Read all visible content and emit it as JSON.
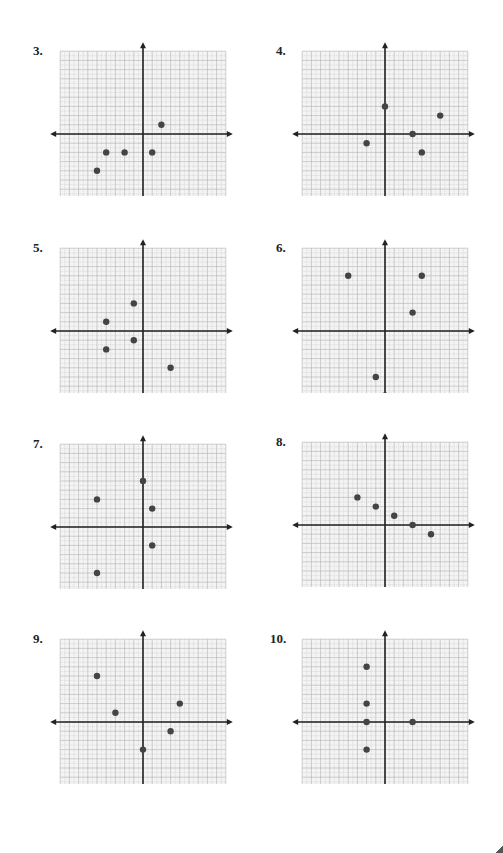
{
  "page": {
    "grid": {
      "min": -9,
      "max": 9,
      "unit_px": 9.2,
      "minor_grid_color": "#c8c8c8",
      "major_grid_color": "#b0b0b0",
      "background": "#f4f4f4",
      "axis_color": "#222222",
      "point_color": "#444444"
    }
  },
  "chart_data": [
    {
      "type": "scatter",
      "title": "3.",
      "xlim": [
        -9,
        9
      ],
      "ylim": [
        -9,
        9
      ],
      "grid": true,
      "x": [
        2,
        -4,
        -2,
        1,
        -5
      ],
      "y": [
        1,
        -2,
        -2,
        -2,
        -4
      ],
      "points": [
        [
          2,
          1
        ],
        [
          -4,
          -2
        ],
        [
          -2,
          -2
        ],
        [
          1,
          -2
        ],
        [
          -5,
          -4
        ]
      ]
    },
    {
      "type": "scatter",
      "title": "4.",
      "xlim": [
        -9,
        9
      ],
      "ylim": [
        -9,
        9
      ],
      "grid": true,
      "x": [
        0,
        6,
        3,
        -2,
        4
      ],
      "y": [
        3,
        2,
        0,
        -1,
        -2
      ],
      "points": [
        [
          0,
          3
        ],
        [
          6,
          2
        ],
        [
          3,
          0
        ],
        [
          -2,
          -1
        ],
        [
          4,
          -2
        ]
      ]
    },
    {
      "type": "scatter",
      "title": "5.",
      "xlim": [
        -9,
        9
      ],
      "ylim": [
        -9,
        9
      ],
      "grid": true,
      "x": [
        -1,
        -4,
        -1,
        -4,
        3
      ],
      "y": [
        3,
        1,
        -1,
        -2,
        -4
      ],
      "points": [
        [
          -1,
          3
        ],
        [
          -4,
          1
        ],
        [
          -1,
          -1
        ],
        [
          -4,
          -2
        ],
        [
          3,
          -4
        ]
      ]
    },
    {
      "type": "scatter",
      "title": "6.",
      "xlim": [
        -9,
        9
      ],
      "ylim": [
        -9,
        9
      ],
      "grid": true,
      "x": [
        -4,
        4,
        3,
        -1,
        0
      ],
      "y": [
        6,
        6,
        2,
        -5,
        -7
      ],
      "points": [
        [
          -4,
          6
        ],
        [
          4,
          6
        ],
        [
          3,
          2
        ],
        [
          -1,
          -5
        ],
        [
          0,
          -7
        ]
      ]
    },
    {
      "type": "scatter",
      "title": "7.",
      "xlim": [
        -9,
        9
      ],
      "ylim": [
        -9,
        9
      ],
      "grid": true,
      "x": [
        0,
        -5,
        1,
        1,
        -5
      ],
      "y": [
        5,
        3,
        2,
        -2,
        -5
      ],
      "points": [
        [
          0,
          5
        ],
        [
          -5,
          3
        ],
        [
          1,
          2
        ],
        [
          1,
          -2
        ],
        [
          -5,
          -5
        ]
      ]
    },
    {
      "type": "scatter",
      "title": "8.",
      "xlim": [
        -9,
        9
      ],
      "ylim": [
        -9,
        9
      ],
      "grid": true,
      "x": [
        -3,
        -1,
        1,
        3,
        5
      ],
      "y": [
        3,
        2,
        1,
        0,
        -1
      ],
      "points": [
        [
          -3,
          3
        ],
        [
          -1,
          2
        ],
        [
          1,
          1
        ],
        [
          3,
          0
        ],
        [
          5,
          -1
        ]
      ]
    },
    {
      "type": "scatter",
      "title": "9.",
      "xlim": [
        -9,
        9
      ],
      "ylim": [
        -9,
        9
      ],
      "grid": true,
      "x": [
        -5,
        -3,
        4,
        3,
        0
      ],
      "y": [
        5,
        1,
        2,
        -1,
        -3
      ],
      "points": [
        [
          -5,
          5
        ],
        [
          -3,
          1
        ],
        [
          4,
          2
        ],
        [
          3,
          -1
        ],
        [
          0,
          -3
        ]
      ]
    },
    {
      "type": "scatter",
      "title": "10.",
      "xlim": [
        -9,
        9
      ],
      "ylim": [
        -9,
        9
      ],
      "grid": true,
      "x": [
        -2,
        -2,
        -2,
        3,
        -2
      ],
      "y": [
        6,
        2,
        0,
        0,
        -3
      ],
      "points": [
        [
          -2,
          6
        ],
        [
          -2,
          2
        ],
        [
          -2,
          0
        ],
        [
          3,
          0
        ],
        [
          -2,
          -3
        ]
      ]
    }
  ],
  "panels": [
    {
      "label": "3.",
      "left": 0,
      "top": 0,
      "label_x": 33,
      "label_y": 43
    },
    {
      "label": "4.",
      "left": 242,
      "top": 0,
      "label_x": 276,
      "label_y": 43
    },
    {
      "label": "5.",
      "left": 0,
      "top": 197,
      "label_x": 33,
      "label_y": 240
    },
    {
      "label": "6.",
      "left": 242,
      "top": 197,
      "label_x": 276,
      "label_y": 240
    },
    {
      "label": "7.",
      "left": 0,
      "top": 393,
      "label_x": 33,
      "label_y": 436
    },
    {
      "label": "8.",
      "left": 242,
      "top": 391,
      "label_x": 276,
      "label_y": 434
    },
    {
      "label": "9.",
      "left": 0,
      "top": 588,
      "label_x": 33,
      "label_y": 631
    },
    {
      "label": "10.",
      "left": 242,
      "top": 588,
      "label_x": 270,
      "label_y": 631
    }
  ]
}
